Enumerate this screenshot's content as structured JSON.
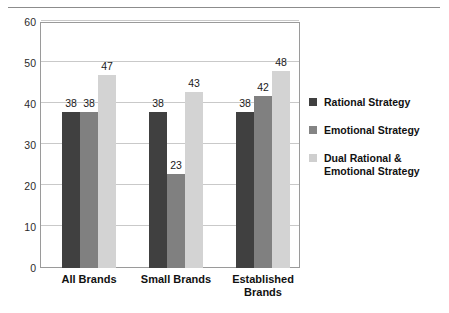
{
  "chart_data": {
    "type": "bar",
    "title": "",
    "subtitle": "",
    "xlabel": "",
    "ylabel": "",
    "ylim": [
      0,
      60
    ],
    "yticks": [
      0,
      10,
      20,
      30,
      40,
      50,
      60
    ],
    "grid": true,
    "legend_position": "right",
    "categories": [
      "All Brands",
      "Small Brands",
      "Established Brands"
    ],
    "series": [
      {
        "name": "Rational Strategy",
        "color": "#404040",
        "values": [
          38,
          38,
          38
        ]
      },
      {
        "name": "Emotional Strategy",
        "color": "#808080",
        "values": [
          38,
          23,
          42
        ]
      },
      {
        "name": "Dual Rational & Emotional Strategy",
        "color": "#d3d3d3",
        "values": [
          47,
          43,
          48
        ]
      }
    ],
    "data_labels": [
      [
        "38",
        "38",
        "47"
      ],
      [
        "38",
        "23",
        "43"
      ],
      [
        "38",
        "42",
        "48"
      ]
    ],
    "ytick_labels": [
      "0",
      "10",
      "20",
      "30",
      "40",
      "50",
      "60"
    ]
  },
  "legend": {
    "items": [
      {
        "label": "Rational Strategy",
        "color": "#404040"
      },
      {
        "label": "Emotional Strategy",
        "color": "#808080"
      },
      {
        "label": "Dual Rational & Emotional Strategy",
        "color": "#d3d3d3"
      }
    ]
  },
  "axis": {
    "category_labels": [
      "All Brands",
      "Small Brands",
      "Established Brands"
    ]
  }
}
